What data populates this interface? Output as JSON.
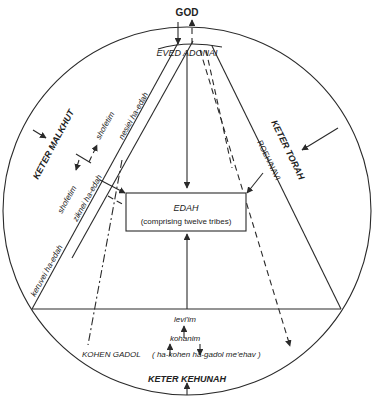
{
  "diagram": {
    "top_label": "GOD",
    "top_arc_label": "EVED ADONAI",
    "center_box": {
      "title": "EDAH",
      "subtitle": "(comprising twelve tribes)"
    },
    "crowns": {
      "left": "KETER MALKHUT",
      "right": "KETER TORAH",
      "bottom": "KETER KEHUNAH"
    },
    "left_band": {
      "keruvei": "keruvei ha-edah",
      "ziknei": "ziknei ha-edah",
      "nesiei": "nesiei ha-edah",
      "shofetim_upper": "shofetim",
      "shofetim_lower": "shofetim"
    },
    "right_band": {
      "roeh": "ROEH/NAVI"
    },
    "bottom_section": {
      "leviim": "levi'im",
      "kohanim": "kohanim",
      "kohen_gadol": "KOHEN GADOL",
      "kohen_gadol_hebrew": "( ha-kohen  ha-gadol  me'ehav )"
    },
    "colors": {
      "line": "#2a2a2a",
      "background": "#ffffff"
    }
  }
}
